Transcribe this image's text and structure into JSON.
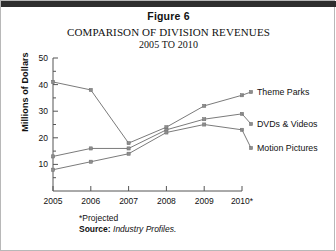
{
  "figure": {
    "label": "Figure 6",
    "title_line1": "COMPARISON OF DIVISION REVENUES",
    "title_line2": "2005 TO 2010"
  },
  "footnote": {
    "projected_note": "*Projected",
    "source_label": "Source:",
    "source_name": "Industry Profiles."
  },
  "chart_data": {
    "type": "line",
    "title": "COMPARISON OF DIVISION REVENUES 2005 TO 2010",
    "xlabel": "",
    "ylabel": "Millions of Dollars",
    "categories": [
      "2005",
      "2006",
      "2007",
      "2008",
      "2009",
      "2010*"
    ],
    "xtick_labels": [
      "2005",
      "2006",
      "2007",
      "2008",
      "2009",
      "2010*"
    ],
    "ytick_labels": [
      "10",
      "20",
      "30",
      "40",
      "50"
    ],
    "yticks": [
      10,
      20,
      30,
      40,
      50
    ],
    "ylim": [
      0,
      50
    ],
    "grid": false,
    "legend_position": "right-of-lines",
    "series": [
      {
        "name": "Theme Parks",
        "values": [
          41,
          38,
          18,
          24,
          32,
          36
        ]
      },
      {
        "name": "DVDs & Videos",
        "values": [
          13,
          16,
          16,
          23,
          27,
          29
        ]
      },
      {
        "name": "Motion Pictures",
        "values": [
          8,
          11,
          14,
          22,
          25,
          23
        ]
      }
    ],
    "annotations": [
      "*Projected",
      "Source: Industry Profiles."
    ],
    "colors": {
      "series_line": "#7b7b7b",
      "marker": "#8d8d8d",
      "axis": "#555555",
      "text": "#111111"
    }
  }
}
